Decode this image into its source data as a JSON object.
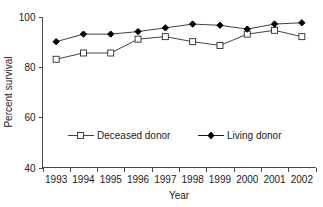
{
  "chart_data": {
    "type": "line",
    "title": "",
    "xlabel": "Year",
    "ylabel": "Percent survival",
    "categories": [
      "1993",
      "1994",
      "1995",
      "1996",
      "1997",
      "1998",
      "1999",
      "2000",
      "2001",
      "2002"
    ],
    "x": [
      1993,
      1994,
      1995,
      1996,
      1997,
      1998,
      1999,
      2000,
      2001,
      2002
    ],
    "ylim": [
      40,
      100
    ],
    "yticks": [
      40,
      60,
      80,
      100
    ],
    "ytick_labels": [
      "40",
      "60",
      "80",
      "100"
    ],
    "xtick_labels": [
      "1993",
      "1994",
      "1995",
      "1996",
      "1997",
      "1998",
      "1999",
      "2000",
      "2001",
      "2002"
    ],
    "grid": false,
    "legend_position": "inside-lower-center",
    "series": [
      {
        "name": "Deceased donor",
        "marker": "open-square",
        "color": "#2b2b2b",
        "values": [
          83,
          85.5,
          85.5,
          91,
          92,
          90,
          88.5,
          93,
          94.5,
          92
        ]
      },
      {
        "name": "Living donor",
        "marker": "filled-diamond",
        "color": "#000000",
        "values": [
          90,
          93,
          93,
          94,
          95.5,
          97,
          96.5,
          95,
          97,
          97.5
        ]
      }
    ]
  },
  "axes": {
    "y_title": "Percent survival",
    "x_title": "Year"
  },
  "legend": {
    "entries": [
      {
        "label": "Deceased donor",
        "marker": "open-square"
      },
      {
        "label": "Living donor",
        "marker": "filled-diamond"
      }
    ]
  }
}
